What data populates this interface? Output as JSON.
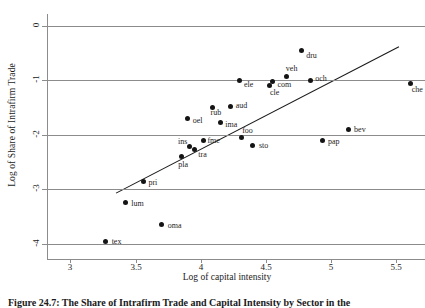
{
  "chart_data": {
    "type": "scatter",
    "title": "",
    "xlabel": "Log of capital intensity",
    "ylabel": "Log of Share of Intrafirm Trade",
    "xlim": [
      2.82,
      5.72
    ],
    "ylim": [
      -4.28,
      0.22
    ],
    "xticks": [
      "3",
      "3.5",
      "4",
      "4.5",
      "5",
      "5.5"
    ],
    "xtickvalues": [
      3,
      3.5,
      4,
      4.5,
      5,
      5.5
    ],
    "yticks": [
      "0",
      "-1",
      "-2",
      "-3",
      "-4"
    ],
    "ytickvalues": [
      0,
      -1,
      -2,
      -3,
      -4
    ],
    "grid": "horizontal",
    "legend": "none",
    "points": [
      {
        "label": "dru",
        "x": 4.77,
        "y": -0.45
      },
      {
        "label": "veh",
        "x": 4.66,
        "y": -0.93
      },
      {
        "label": "och",
        "x": 4.84,
        "y": -1.0
      },
      {
        "label": "com",
        "x": 4.55,
        "y": -1.02
      },
      {
        "label": "cle",
        "x": 4.53,
        "y": -1.09
      },
      {
        "label": "ele",
        "x": 4.3,
        "y": -1.0
      },
      {
        "label": "che",
        "x": 5.61,
        "y": -1.05
      },
      {
        "label": "aud",
        "x": 4.23,
        "y": -1.48
      },
      {
        "label": "rub",
        "x": 4.09,
        "y": -1.49
      },
      {
        "label": "oel",
        "x": 3.9,
        "y": -1.7
      },
      {
        "label": "ima",
        "x": 4.15,
        "y": -1.78
      },
      {
        "label": "bev",
        "x": 5.13,
        "y": -1.91
      },
      {
        "label": "foo",
        "x": 4.31,
        "y": -2.04
      },
      {
        "label": "fme",
        "x": 4.02,
        "y": -2.1
      },
      {
        "label": "pap",
        "x": 4.93,
        "y": -2.11
      },
      {
        "label": "sto",
        "x": 4.4,
        "y": -2.19
      },
      {
        "label": "ins",
        "x": 3.91,
        "y": -2.21
      },
      {
        "label": "tra",
        "x": 3.95,
        "y": -2.26
      },
      {
        "label": "pla",
        "x": 3.85,
        "y": -2.4
      },
      {
        "label": "pri",
        "x": 3.56,
        "y": -2.85
      },
      {
        "label": "lum",
        "x": 3.42,
        "y": -3.25
      },
      {
        "label": "oma",
        "x": 3.7,
        "y": -3.65
      },
      {
        "label": "tex",
        "x": 3.27,
        "y": -3.95
      }
    ],
    "fit_line": {
      "name": "regression-line",
      "x0": 3.35,
      "y0": -3.07,
      "x1": 5.52,
      "y1": -0.38,
      "color": "#1a1a1a"
    },
    "colors": {
      "point": "#141414",
      "grid": "#8c8c8c",
      "axis": "#8c8c8c",
      "text": "#1c1c1c"
    }
  },
  "caption": {
    "text": "Figure 24.7: The Share of Intrafirm Trade and Capital Intensity by Sector in the"
  }
}
